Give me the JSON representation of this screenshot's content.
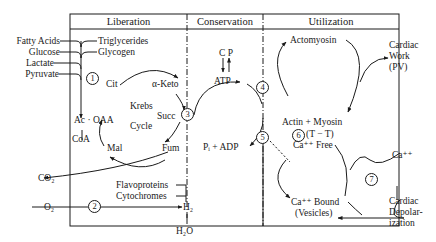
{
  "headers": {
    "liberation": "Liberation",
    "conservation": "Conservation",
    "utilization": "Utilization"
  },
  "substrates": {
    "fatty_acids": "Fatty Acids",
    "glucose": "Glucose",
    "lactate": "Lactate",
    "pyruvate": "Pyruvate",
    "triglycerides": "Triglycerides",
    "glycogen": "Glycogen"
  },
  "krebs": {
    "title_line1": "Krebs",
    "title_line2": "Cycle",
    "cit": "Cit",
    "alpha_keto": "α-Keto",
    "succ": "Succ",
    "fum": "Fum",
    "mal": "Mal",
    "ac_oaa": "Ac · OAA",
    "coa": "CoA"
  },
  "respiration": {
    "co2": "CO₂",
    "o2": "O₂",
    "flavoproteins": "Flavoproteins",
    "cytochromes": "Cytochromes",
    "h2": "H₂",
    "h2o": "H₂O"
  },
  "conservation": {
    "cp": "C P",
    "atp": "ATP",
    "pi_adp": "Pᵢ + ADP"
  },
  "utilization": {
    "actomyosin": "Actomyosin",
    "actin_myosin": "Actin + Myosin",
    "tt": "(T − T)",
    "ca_free": "Ca⁺⁺ Free",
    "ca_bound": "Ca⁺⁺ Bound",
    "vesicles": "(Vesicles)"
  },
  "outputs": {
    "cardiac_work_1": "Cardiac",
    "cardiac_work_2": "Work",
    "cardiac_work_3": "(PV)",
    "ca_ext": "Ca⁺⁺",
    "depol_1": "Cardiac",
    "depol_2": "Depolar-",
    "depol_3": "ization"
  },
  "steps": [
    "1",
    "2",
    "3",
    "4",
    "5",
    "6",
    "7"
  ]
}
